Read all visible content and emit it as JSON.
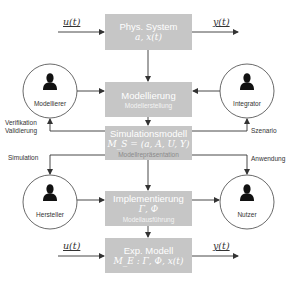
{
  "colors": {
    "box_fill": "#c6c6c6",
    "box_text": "#ffffff",
    "line": "#333333",
    "actor_fill": "#111111"
  },
  "boxes": {
    "phys_system": {
      "title": "Phys. System",
      "math": "a, x(t)"
    },
    "modellierung": {
      "title": "Modellierung",
      "subtitle": "Modellerstellung"
    },
    "simulationsmodell": {
      "title": "Simulationsmodell",
      "math": "M_S = (a, A, U, Y)",
      "subtitle": "Modellrepräsentation"
    },
    "implementierung": {
      "title": "Implementierung",
      "math": "Γ, Φ",
      "subtitle": "Modellausführung"
    },
    "exp_modell": {
      "title": "Exp. Modell",
      "math": "M_E : Γ, Φ, x(t)"
    }
  },
  "signals": {
    "top_input": "u(t)",
    "top_output": "y(t)",
    "bottom_input": "u(t)",
    "bottom_output": "y(t)"
  },
  "actors": {
    "modellierer": {
      "name": "Modellierer",
      "icon": "person-icon"
    },
    "integrator": {
      "name": "Integrator",
      "icon": "person-icon"
    },
    "hersteller": {
      "name": "Hersteller",
      "icon": "person-icon"
    },
    "nutzer": {
      "name": "Nutzer",
      "icon": "person-icon"
    }
  },
  "edge_labels": {
    "verifikation": "Verifikation",
    "validierung": "Validierung",
    "szenario": "Szenario",
    "simulation": "Simulation",
    "anwendung": "Anwendung"
  }
}
